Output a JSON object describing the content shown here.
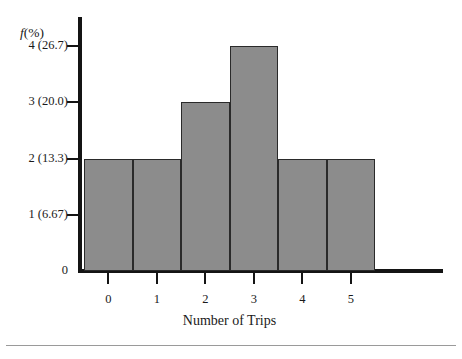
{
  "chart_data": {
    "type": "bar",
    "title": "",
    "xlabel": "Number of Trips",
    "ylabel": "f(%)",
    "ylabel_parts": {
      "italic": "f",
      "upright": "(%)"
    },
    "categories": [
      "0",
      "1",
      "2",
      "3",
      "4",
      "5"
    ],
    "values": [
      2,
      2,
      3,
      4,
      2,
      2
    ],
    "ylim": [
      0,
      4.5
    ],
    "grid": false,
    "legend": null,
    "bar_style": "contiguous-histogram",
    "bar_fill_color": "#8c8c8c",
    "bar_edge_color": "#2a2a2a",
    "axis_color": "#141414",
    "background_color": "#ffffff",
    "yticks": [
      {
        "value": 0,
        "label": "0",
        "has_tick_mark": false
      },
      {
        "value": 1,
        "label": "1 (6.67)",
        "has_tick_mark": true
      },
      {
        "value": 2,
        "label": "2 (13.3)",
        "has_tick_mark": true
      },
      {
        "value": 3,
        "label": "3 (20.0)",
        "has_tick_mark": true
      },
      {
        "value": 4,
        "label": "4 (26.7)",
        "has_tick_mark": true
      }
    ],
    "xticks": [
      {
        "value": 0,
        "label": "0"
      },
      {
        "value": 1,
        "label": "1"
      },
      {
        "value": 2,
        "label": "2"
      },
      {
        "value": 3,
        "label": "3"
      },
      {
        "value": 4,
        "label": "4"
      },
      {
        "value": 5,
        "label": "5"
      }
    ]
  }
}
